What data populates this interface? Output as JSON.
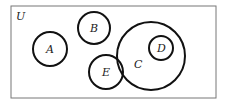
{
  "diagram": {
    "type": "venn",
    "universe": {
      "label": "U",
      "x": 11,
      "y": 6,
      "width": 205,
      "height": 92
    },
    "sets": [
      {
        "label": "A",
        "cx": 50,
        "cy": 49,
        "r": 17
      },
      {
        "label": "B",
        "cx": 94,
        "cy": 28,
        "r": 16
      },
      {
        "label": "E",
        "cx": 106,
        "cy": 72,
        "r": 17
      },
      {
        "label": "C",
        "cx": 151,
        "cy": 56,
        "r": 34,
        "label_x": 136,
        "label_y": 68
      },
      {
        "label": "D",
        "cx": 161,
        "cy": 48,
        "r": 12
      }
    ],
    "relations": {
      "D_subset_of": "C",
      "E_overlaps": "C",
      "A_disjoint": true,
      "B_disjoint": true
    },
    "colors": {
      "stroke": "#111111",
      "frame": "#777777",
      "background": "#ffffff"
    }
  }
}
